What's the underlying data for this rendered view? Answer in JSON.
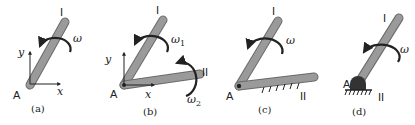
{
  "figure": {
    "panels": [
      {
        "caption": "(a)",
        "link_label": "I",
        "pivot_label": "A",
        "omega_label": "ω",
        "axis_x_label": "x",
        "axis_y_label": "y"
      },
      {
        "caption": "(b)",
        "link1_label": "I",
        "link2_label": "II",
        "pivot_label": "A",
        "omega1_label": "ω",
        "omega1_sub": "1",
        "omega2_label": "ω",
        "omega2_sub": "2",
        "axis_x_label": "x",
        "axis_y_label": "y"
      },
      {
        "caption": "(c)",
        "link1_label": "I",
        "link2_label": "II",
        "pivot_label": "A",
        "omega_label": "ω"
      },
      {
        "caption": "(d)",
        "link1_label": "I",
        "ground_label": "II",
        "pivot_label": "A",
        "omega_label": "ω"
      }
    ],
    "colors": {
      "link_fill": "#9a9a9a",
      "link_edge": "#6a6a6a",
      "ink": "#222222"
    }
  }
}
